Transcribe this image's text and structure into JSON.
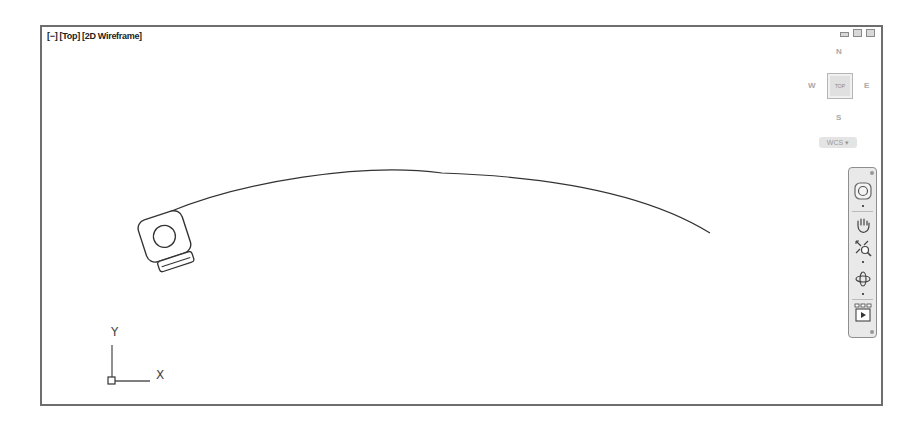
{
  "viewport": {
    "label": "[−] [Top] [2D Wireframe]",
    "window_controls": [
      "minimize-icon",
      "restore-icon",
      "close-icon"
    ]
  },
  "viewcube": {
    "north": "N",
    "south": "S",
    "east": "E",
    "west": "W",
    "face": "TOP",
    "ucs_menu": "WCS ▾"
  },
  "navbar": {
    "tools": [
      "steering-wheel-icon",
      "pan-icon",
      "zoom-extents-icon",
      "orbit-icon",
      "showmotion-icon"
    ]
  },
  "ucs_icon": {
    "x_label": "X",
    "y_label": "Y"
  },
  "drawing": {
    "objects": [
      "camera-glyph",
      "arc-path"
    ]
  }
}
